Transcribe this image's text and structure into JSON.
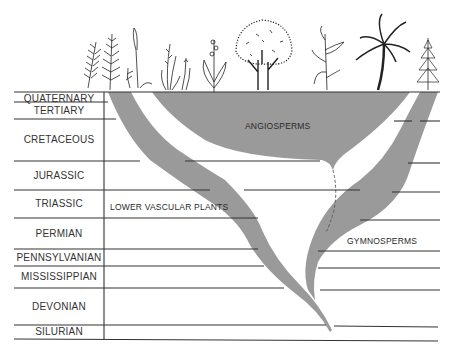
{
  "diagram": {
    "type": "phylogenetic-timeline",
    "colors": {
      "lineage_fill": "#9a9a9a",
      "grid_line": "#333333",
      "background": "#ffffff"
    },
    "periods": [
      {
        "name": "QUATERNARY",
        "top": 92,
        "bottom": 102
      },
      {
        "name": "TERTIARY",
        "top": 102,
        "bottom": 119
      },
      {
        "name": "CRETACEOUS",
        "top": 119,
        "bottom": 161
      },
      {
        "name": "JURASSIC",
        "top": 161,
        "bottom": 190
      },
      {
        "name": "TRIASSIC",
        "top": 190,
        "bottom": 218
      },
      {
        "name": "PERMIAN",
        "top": 218,
        "bottom": 249
      },
      {
        "name": "PENNSYLVANIAN",
        "top": 249,
        "bottom": 266
      },
      {
        "name": "MISSISSIPPIAN",
        "top": 266,
        "bottom": 288
      },
      {
        "name": "DEVONIAN",
        "top": 288,
        "bottom": 325
      },
      {
        "name": "SILURIAN",
        "top": 325,
        "bottom": 339
      }
    ],
    "groups": [
      {
        "name": "LOWER VASCULAR PLANTS",
        "x": 110,
        "y": 206
      },
      {
        "name": "ANGIOSPERMS",
        "x": 245,
        "y": 125
      },
      {
        "name": "GYMNOSPERMS",
        "x": 347,
        "y": 240
      }
    ],
    "illustrations": [
      "club-moss",
      "horsetail",
      "fern-with-spike",
      "grass",
      "grass-sprig",
      "orchid",
      "deciduous-tree",
      "corn-plant",
      "palm-tree",
      "conifer"
    ]
  }
}
